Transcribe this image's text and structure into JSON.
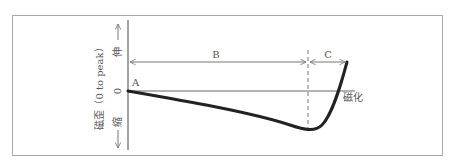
{
  "diagram": {
    "y_axis": {
      "label": "磁歪（0 to peak）",
      "top_label": "伸",
      "bottom_label": "縮",
      "zero_label": "0"
    },
    "x_axis": {
      "label": "磁化"
    },
    "points": {
      "start": "A"
    },
    "regions": [
      {
        "label": "B"
      },
      {
        "label": "C"
      }
    ],
    "colors": {
      "curve": "#222222",
      "lines": "#777777",
      "frame": "#aaaaaa",
      "text": "#555555"
    }
  }
}
